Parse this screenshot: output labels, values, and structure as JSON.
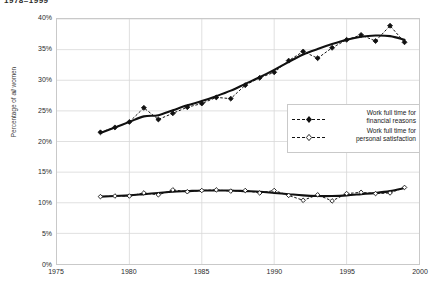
{
  "title_fragment": "1978–1999",
  "caption": "",
  "axes": {
    "ylabel_pre": "Percentage of ",
    "ylabel_em": "all",
    "ylabel_post": " women",
    "yticks": [
      "40%",
      "35%",
      "30%",
      "25%",
      "20%",
      "15%",
      "10%",
      "5%",
      "0%"
    ],
    "xticks": [
      "1975",
      "1980",
      "1985",
      "1990",
      "1995",
      "2000"
    ]
  },
  "legend": {
    "items": [
      {
        "label_line1": "Work full time for",
        "label_line2": "financial reasons",
        "marker": "filled-diamond-marker"
      },
      {
        "label_line1": "Work full time for",
        "label_line2": "personal satisfaction",
        "marker": "open-diamond-marker"
      }
    ]
  },
  "colors": {
    "line": "#111111",
    "grid": "#d8d8d8",
    "frame": "#c9c9c9",
    "text": "#1a1a1a"
  },
  "chart_data": {
    "type": "line",
    "title": "1978–1999",
    "xlabel": "",
    "ylabel": "Percentage of all women",
    "xlim": [
      1975,
      2000
    ],
    "ylim": [
      0,
      40
    ],
    "ytick_values": [
      0,
      5,
      10,
      15,
      20,
      25,
      30,
      35,
      40
    ],
    "xtick_values": [
      1975,
      1980,
      1985,
      1990,
      1995,
      2000
    ],
    "grid": true,
    "legend_position": "center-right",
    "x": [
      1978,
      1979,
      1980,
      1981,
      1982,
      1983,
      1984,
      1985,
      1986,
      1987,
      1988,
      1989,
      1990,
      1991,
      1992,
      1993,
      1994,
      1995,
      1996,
      1997,
      1998,
      1999
    ],
    "series": [
      {
        "name": "Work full time for financial reasons",
        "marker": "filled-diamond",
        "linestyle": "dashed",
        "values": [
          21.5,
          22.3,
          23.2,
          25.5,
          23.6,
          24.6,
          25.6,
          26.2,
          27.2,
          27.0,
          29.2,
          30.4,
          31.3,
          33.2,
          34.7,
          33.6,
          35.3,
          36.6,
          37.4,
          36.4,
          38.9,
          36.2
        ],
        "trend": {
          "name": "smooth trend (financial reasons)",
          "linestyle": "solid",
          "values": [
            21.4,
            22.3,
            23.2,
            24.1,
            24.3,
            25.1,
            25.9,
            26.6,
            27.4,
            28.3,
            29.4,
            30.5,
            31.7,
            33.0,
            34.2,
            35.1,
            35.9,
            36.6,
            37.1,
            37.3,
            37.2,
            36.6
          ]
        }
      },
      {
        "name": "Work full time for personal satisfaction",
        "marker": "open-diamond",
        "linestyle": "dashed",
        "values": [
          11.0,
          11.1,
          11.1,
          11.6,
          11.3,
          12.1,
          11.8,
          12.0,
          12.1,
          11.9,
          12.0,
          11.6,
          12.0,
          11.2,
          10.4,
          11.3,
          10.3,
          11.5,
          11.7,
          11.5,
          11.6,
          12.5
        ],
        "trend": {
          "name": "smooth trend (personal satisfaction)",
          "linestyle": "solid",
          "values": [
            11.0,
            11.1,
            11.2,
            11.4,
            11.6,
            11.8,
            11.9,
            12.0,
            12.0,
            12.0,
            11.9,
            11.8,
            11.6,
            11.4,
            11.2,
            11.1,
            11.1,
            11.2,
            11.4,
            11.6,
            11.9,
            12.4
          ]
        }
      }
    ]
  }
}
